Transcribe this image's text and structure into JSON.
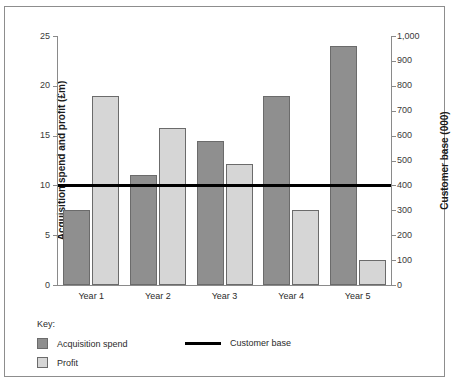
{
  "chart_data": {
    "type": "bar",
    "title": "",
    "categories": [
      "Year 1",
      "Year 2",
      "Year 3",
      "Year 4",
      "Year 5"
    ],
    "series": [
      {
        "name": "Acquisition spend",
        "type": "bar",
        "axis": "left",
        "color": "#8f8f8f",
        "values": [
          7.5,
          11,
          14.5,
          19,
          24
        ]
      },
      {
        "name": "Profit",
        "type": "bar",
        "axis": "left",
        "color": "#d6d6d6",
        "values": [
          19,
          15.8,
          12.2,
          7.5,
          2.5
        ]
      },
      {
        "name": "Customer base",
        "type": "line",
        "axis": "right",
        "color": "#000000",
        "values": [
          400,
          400,
          400,
          400,
          400
        ]
      }
    ],
    "xlabel": "",
    "ylabel": "Acquisition spend and profit (£m)",
    "y2label": "Customer base (000)",
    "ylim": [
      0,
      25
    ],
    "y2lim": [
      0,
      1000
    ],
    "yticks": [
      "0",
      "5",
      "10",
      "15",
      "20",
      "25"
    ],
    "ytick_values": [
      0,
      5,
      10,
      15,
      20,
      25
    ],
    "y2ticks": [
      "0",
      "100",
      "200",
      "300",
      "400",
      "500",
      "600",
      "700",
      "800",
      "900",
      "1,000"
    ],
    "y2tick_values": [
      0,
      100,
      200,
      300,
      400,
      500,
      600,
      700,
      800,
      900,
      1000
    ],
    "grid": false,
    "legend_position": "below-left"
  },
  "legend": {
    "title": "Key:",
    "items": [
      {
        "label": "Acquisition spend",
        "marker": "dark-square-swatch"
      },
      {
        "label": "Profit",
        "marker": "light-square-swatch"
      },
      {
        "label": "Customer base",
        "marker": "black-line-swatch"
      }
    ]
  }
}
